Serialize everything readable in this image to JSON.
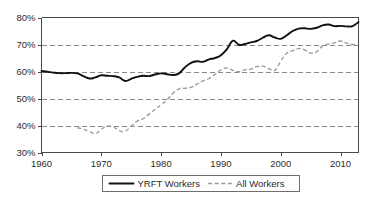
{
  "chart_data": {
    "type": "line",
    "title": "",
    "subtitle": "",
    "xlabel": "",
    "ylabel": "",
    "xlim": [
      1960,
      2013
    ],
    "ylim": [
      30,
      80
    ],
    "grid": true,
    "grid_values": [
      40,
      50,
      60,
      70
    ],
    "legend_position": "bottom-center",
    "y_tick_labels": [
      "80%",
      "70%",
      "60%",
      "50%",
      "40%",
      "30%"
    ],
    "y_tick_values": [
      80,
      70,
      60,
      50,
      40,
      30
    ],
    "x_tick_labels": [
      "1960",
      "1970",
      "1980",
      "1990",
      "2000",
      "2010"
    ],
    "x_tick_values": [
      1960,
      1970,
      1980,
      1990,
      2000,
      2010
    ],
    "x": [
      1960,
      1961,
      1962,
      1963,
      1964,
      1965,
      1966,
      1967,
      1968,
      1969,
      1970,
      1971,
      1972,
      1973,
      1974,
      1975,
      1976,
      1977,
      1978,
      1979,
      1980,
      1981,
      1982,
      1983,
      1984,
      1985,
      1986,
      1987,
      1988,
      1989,
      1990,
      1991,
      1992,
      1993,
      1994,
      1995,
      1996,
      1997,
      1998,
      1999,
      2000,
      2001,
      2002,
      2003,
      2004,
      2005,
      2006,
      2007,
      2008,
      2009,
      2010,
      2011,
      2012,
      2013
    ],
    "series": [
      {
        "name": "YRFT Workers",
        "style": "solid",
        "color": "#111111",
        "values": [
          60.2,
          59.9,
          59.6,
          59.4,
          59.4,
          59.5,
          59.3,
          58.3,
          57.4,
          57.8,
          58.6,
          58.4,
          58.3,
          57.8,
          56.5,
          57.3,
          58.0,
          58.4,
          58.3,
          58.9,
          59.3,
          59.0,
          58.7,
          59.3,
          61.6,
          63.2,
          63.8,
          63.6,
          64.5,
          65.0,
          66.0,
          68.3,
          71.4,
          69.9,
          70.2,
          70.8,
          71.3,
          72.5,
          73.4,
          72.6,
          72.1,
          73.4,
          75.0,
          75.9,
          76.0,
          75.8,
          76.2,
          77.1,
          77.4,
          76.8,
          76.9,
          76.7,
          76.8,
          78.3
        ]
      },
      {
        "name": "All Workers",
        "style": "dashed",
        "color": "#9a9a9a",
        "values": [
          null,
          null,
          null,
          null,
          null,
          null,
          39.2,
          38.6,
          37.8,
          37.0,
          38.6,
          39.7,
          39.5,
          38.1,
          37.9,
          39.8,
          41.6,
          42.5,
          44.3,
          46.0,
          47.7,
          49.5,
          52.0,
          53.6,
          53.8,
          54.1,
          55.3,
          56.5,
          57.4,
          58.9,
          60.6,
          61.3,
          60.4,
          59.9,
          60.6,
          60.9,
          61.8,
          62.0,
          61.1,
          60.4,
          63.8,
          66.8,
          67.7,
          68.5,
          68.0,
          66.8,
          67.3,
          69.5,
          70.2,
          70.6,
          71.3,
          70.5,
          70.0,
          69.9
        ]
      }
    ]
  },
  "legend": {
    "items": [
      {
        "label": "YRFT Workers",
        "style": "solid"
      },
      {
        "label": "All Workers",
        "style": "dashed"
      }
    ]
  }
}
